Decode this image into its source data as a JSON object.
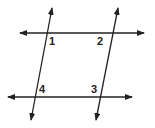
{
  "diagram": {
    "line_color": "#222222",
    "lines": [
      {
        "name": "top-horizontal-line",
        "x1": 20,
        "y1": 33,
        "x2": 144,
        "y2": 33,
        "arrows": "both"
      },
      {
        "name": "bottom-horizontal-line",
        "x1": 8,
        "y1": 97,
        "x2": 132,
        "y2": 97,
        "arrows": "both"
      },
      {
        "name": "left-transversal",
        "x1": 52,
        "y1": 8,
        "x2": 31,
        "y2": 120,
        "arrows": "both"
      },
      {
        "name": "right-transversal",
        "x1": 118,
        "y1": 8,
        "x2": 96,
        "y2": 120,
        "arrows": "both"
      }
    ],
    "labels": [
      {
        "name": "angle-label-1",
        "text": "1",
        "x": 49,
        "y": 45
      },
      {
        "name": "angle-label-2",
        "text": "2",
        "x": 97,
        "y": 45
      },
      {
        "name": "angle-label-4",
        "text": "4",
        "x": 39,
        "y": 93
      },
      {
        "name": "angle-label-3",
        "text": "3",
        "x": 91,
        "y": 93
      }
    ]
  }
}
